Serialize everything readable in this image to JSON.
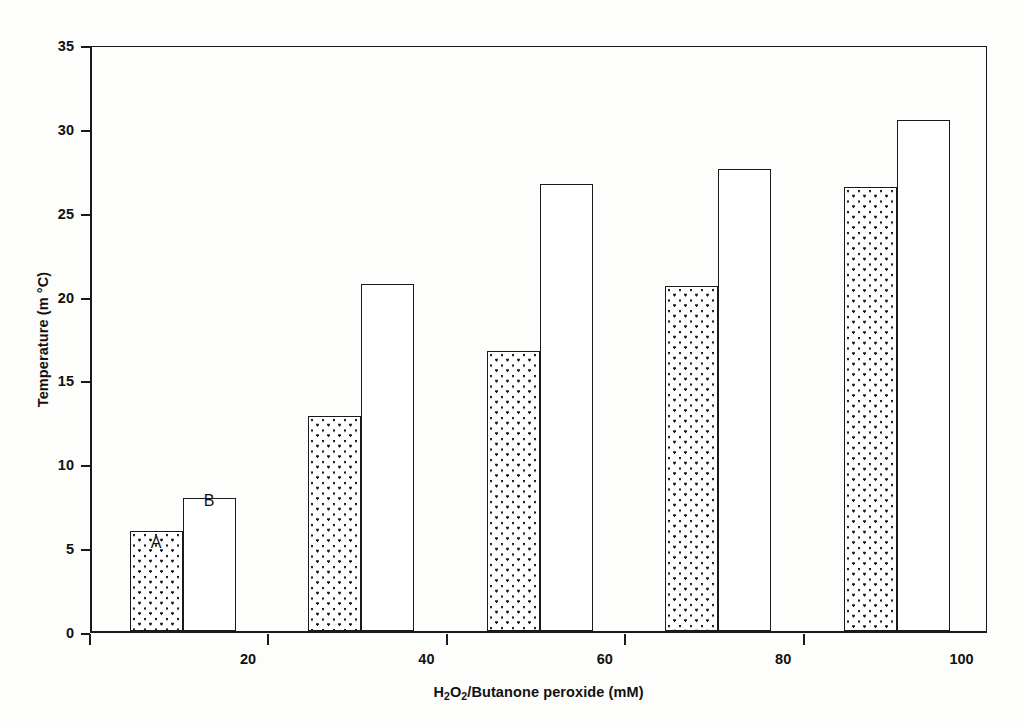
{
  "chart_data": {
    "type": "bar",
    "title": "",
    "subtitle": "",
    "xlabel": "H2O2/Butanone peroxide (mM)",
    "xlabel_parts": [
      {
        "text": "H",
        "sub": false
      },
      {
        "text": "2",
        "sub": true
      },
      {
        "text": "O",
        "sub": false
      },
      {
        "text": "2",
        "sub": true
      },
      {
        "text": "/Butanone peroxide (mM)",
        "sub": false
      }
    ],
    "ylabel": "Temperature (m °C)",
    "categories": [
      "20",
      "40",
      "60",
      "80",
      "100"
    ],
    "category_values": [
      20,
      40,
      60,
      80,
      100
    ],
    "xlim": [
      10,
      110
    ],
    "ylim": [
      0,
      35
    ],
    "ytick_labels": [
      "0",
      "5",
      "10",
      "15",
      "20",
      "25",
      "30",
      "35"
    ],
    "ytick_values": [
      0,
      5,
      10,
      15,
      20,
      25,
      30,
      35
    ],
    "xtick_labels": [
      "20",
      "40",
      "60",
      "80",
      "100"
    ],
    "grid": false,
    "legend": "none",
    "series": [
      {
        "name": "A",
        "fill": "dotted",
        "values": [
          6.0,
          12.9,
          16.8,
          20.7,
          26.6
        ]
      },
      {
        "name": "B",
        "fill": "white",
        "values": [
          8.0,
          20.8,
          26.8,
          27.7,
          30.6
        ]
      }
    ],
    "annotations": [
      {
        "text": "A",
        "series": "A",
        "group": "20",
        "x_value": 20,
        "y_value": 8.5
      },
      {
        "text": "B",
        "series": "B",
        "group": "20",
        "x_value": 20,
        "y_value": 11.0
      }
    ],
    "colors": {
      "axis": "#1a1a1a",
      "bar_outline": "#1a1a1a",
      "series_a_fill": "#ffffff",
      "series_a_pattern": "#1a1a1a",
      "series_b_fill": "#ffffff",
      "background": "#fdfdfc"
    }
  }
}
